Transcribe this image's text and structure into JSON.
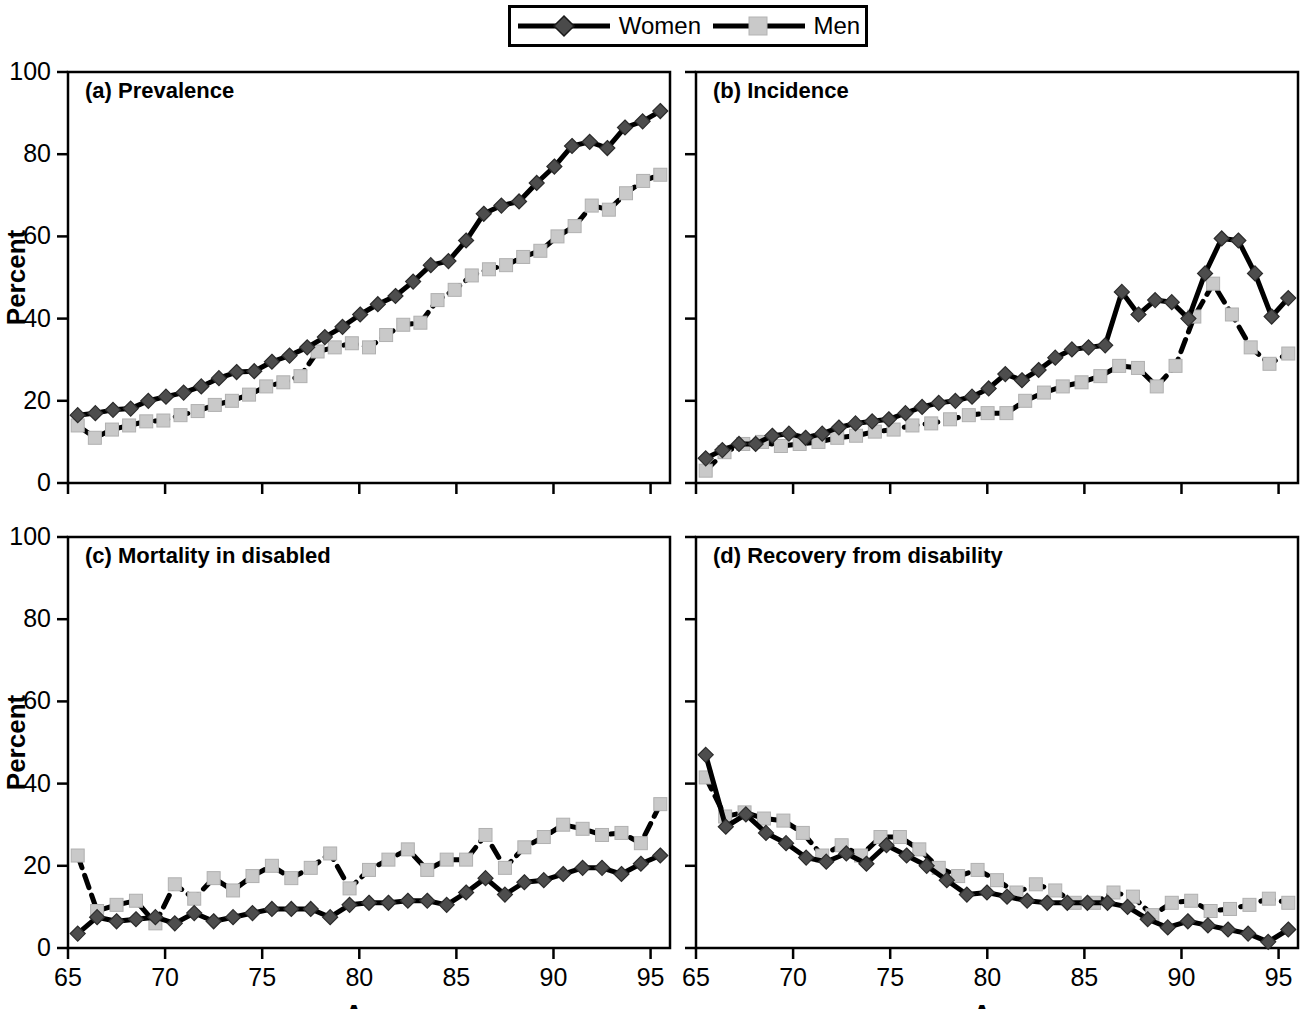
{
  "figure": {
    "width": 1308,
    "height": 1009,
    "background": "#ffffff"
  },
  "legend": {
    "entries": [
      {
        "label": "Women",
        "marker": "diamond",
        "marker_color": "#4d4d4d",
        "line_color": "#000000",
        "line_style": "solid"
      },
      {
        "label": "Men",
        "marker": "square",
        "marker_color": "#c9c9c9",
        "line_color": "#000000",
        "line_style": "dashed"
      }
    ]
  },
  "axis": {
    "x_title": "Age",
    "y_title": "Percent",
    "x_ticks": [
      65,
      70,
      75,
      80,
      85,
      90,
      95
    ],
    "y_ticks": [
      0,
      20,
      40,
      60,
      80,
      100
    ],
    "xlim": [
      65,
      96
    ],
    "ylim": [
      0,
      100
    ]
  },
  "chart_data": [
    {
      "type": "line",
      "panel": "a",
      "title": "(a) Prevalence",
      "xlabel": "Age",
      "ylabel": "Percent",
      "xlim": [
        65,
        96
      ],
      "ylim": [
        0,
        100
      ],
      "grid": false,
      "legend_position": "top-center-shared",
      "x": [
        65.5,
        66.5,
        67.5,
        68.5,
        69.5,
        70.5,
        71.5,
        72.5,
        73.5,
        74.5,
        75.5,
        76.5,
        77.5,
        78.5,
        79.5,
        80.5,
        81.5,
        82.5,
        83.5,
        84.5,
        85.5,
        86.5,
        87.5,
        88.5,
        89.5,
        90.5,
        91.5,
        92.5,
        93.5,
        94.5,
        95.5
      ],
      "series": [
        {
          "name": "Women",
          "values": [
            16.5,
            17.0,
            17.8,
            18.1,
            20.0,
            21.0,
            22.0,
            23.5,
            25.5,
            27.0,
            27.2,
            29.5,
            31.0,
            33.0,
            35.5,
            38.0,
            41.0,
            43.5,
            45.5,
            49.0,
            53.0,
            54.0,
            59.0,
            65.5,
            67.5,
            68.5,
            73.0,
            77.0,
            82.0,
            83.0,
            81.5,
            86.5,
            88.0,
            90.5
          ]
        },
        {
          "name": "Men",
          "values": [
            14.0,
            11.0,
            13.0,
            14.0,
            15.0,
            15.2,
            16.5,
            17.5,
            19.0,
            20.0,
            21.5,
            23.5,
            24.5,
            26.0,
            32.0,
            33.0,
            34.0,
            33.0,
            36.0,
            38.5,
            39.0,
            44.5,
            47.0,
            50.5,
            52.0,
            53.0,
            55.0,
            56.5,
            60.0,
            62.5,
            67.5,
            66.5,
            70.5,
            73.5,
            75.0
          ]
        }
      ]
    },
    {
      "type": "line",
      "panel": "b",
      "title": "(b) Incidence",
      "xlabel": "Age",
      "ylabel": "",
      "xlim": [
        65,
        96
      ],
      "ylim": [
        0,
        100
      ],
      "grid": false,
      "legend_position": "top-center-shared",
      "x": [
        65.5,
        66.5,
        67.5,
        68.5,
        69.5,
        70.5,
        71.5,
        72.5,
        73.5,
        74.5,
        75.5,
        76.5,
        77.5,
        78.5,
        79.5,
        80.5,
        81.5,
        82.5,
        83.5,
        84.5,
        85.5,
        86.5,
        87.5,
        88.5,
        89.5,
        90.5,
        91.5,
        92.5,
        93.5,
        94.5,
        95.5
      ],
      "series": [
        {
          "name": "Women",
          "values": [
            6.0,
            8.0,
            9.5,
            9.5,
            11.5,
            12.0,
            11.0,
            12.0,
            13.5,
            14.5,
            15.0,
            15.5,
            17.0,
            18.5,
            19.5,
            20.0,
            21.0,
            23.0,
            26.5,
            25.0,
            27.5,
            30.5,
            32.5,
            33.0,
            33.5,
            46.5,
            41.0,
            44.5,
            44.0,
            40.0,
            51.0,
            59.5,
            59.0,
            51.0,
            40.5,
            45.0
          ]
        },
        {
          "name": "Men",
          "values": [
            3.0,
            7.5,
            9.5,
            10.0,
            9.0,
            9.5,
            10.0,
            11.0,
            11.5,
            12.5,
            13.0,
            14.0,
            14.5,
            15.5,
            16.5,
            17.0,
            17.0,
            20.0,
            22.0,
            23.5,
            24.5,
            26.0,
            28.5,
            28.0,
            23.5,
            28.5,
            40.5,
            48.5,
            41.0,
            33.0,
            29.0,
            31.5
          ]
        }
      ]
    },
    {
      "type": "line",
      "panel": "c",
      "title": "(c) Mortality in disabled",
      "xlabel": "Age",
      "ylabel": "Percent",
      "xlim": [
        65,
        96
      ],
      "ylim": [
        0,
        100
      ],
      "grid": false,
      "legend_position": "top-center-shared",
      "x": [
        65.5,
        66.5,
        67.5,
        68.5,
        69.5,
        70.5,
        71.5,
        72.5,
        73.5,
        74.5,
        75.5,
        76.5,
        77.5,
        78.5,
        79.5,
        80.5,
        81.5,
        82.5,
        83.5,
        84.5,
        85.5,
        86.5,
        87.5,
        88.5,
        89.5,
        90.5,
        91.5,
        92.5,
        93.5,
        94.5,
        95.5
      ],
      "series": [
        {
          "name": "Women",
          "values": [
            3.5,
            7.5,
            6.5,
            7.0,
            7.5,
            6.0,
            8.5,
            6.5,
            7.5,
            8.5,
            9.5,
            9.5,
            9.5,
            7.5,
            10.5,
            11.0,
            11.0,
            11.5,
            11.5,
            10.5,
            13.5,
            17.0,
            13.0,
            16.0,
            16.5,
            18.0,
            19.5,
            19.5,
            18.0,
            20.5,
            22.5
          ]
        },
        {
          "name": "Men",
          "values": [
            22.5,
            9.0,
            10.5,
            11.5,
            6.0,
            15.5,
            12.0,
            17.0,
            14.0,
            17.5,
            20.0,
            17.0,
            19.5,
            23.0,
            14.5,
            19.0,
            21.5,
            24.0,
            19.0,
            21.5,
            21.5,
            27.5,
            19.5,
            24.5,
            27.0,
            30.0,
            29.0,
            27.5,
            28.0,
            25.5,
            35.0
          ]
        }
      ]
    },
    {
      "type": "line",
      "panel": "d",
      "title": "(d) Recovery from disability",
      "xlabel": "Age",
      "ylabel": "",
      "xlim": [
        65,
        96
      ],
      "ylim": [
        0,
        100
      ],
      "grid": false,
      "legend_position": "top-center-shared",
      "x": [
        65.5,
        66.5,
        67.5,
        68.5,
        69.5,
        70.5,
        71.5,
        72.5,
        73.5,
        74.5,
        75.5,
        76.5,
        77.5,
        78.5,
        79.5,
        80.5,
        81.5,
        82.5,
        83.5,
        84.5,
        85.5,
        86.5,
        87.5,
        88.5,
        89.5,
        90.5,
        91.5,
        92.5,
        93.5,
        94.5,
        95.5
      ],
      "series": [
        {
          "name": "Women",
          "values": [
            47.0,
            29.5,
            32.5,
            28.0,
            25.5,
            22.0,
            21.0,
            23.0,
            20.5,
            25.0,
            22.5,
            20.0,
            16.5,
            13.0,
            13.5,
            12.5,
            11.5,
            11.0,
            11.0,
            11.0,
            11.0,
            10.0,
            7.0,
            5.0,
            6.5,
            5.5,
            4.5,
            3.5,
            1.5,
            4.5
          ]
        },
        {
          "name": "Men",
          "values": [
            41.5,
            32.0,
            33.0,
            31.5,
            31.0,
            28.0,
            22.5,
            25.0,
            22.5,
            27.0,
            27.0,
            24.0,
            19.5,
            17.5,
            19.0,
            16.5,
            13.5,
            15.5,
            14.0,
            11.0,
            11.0,
            13.5,
            12.5,
            8.0,
            11.0,
            11.5,
            9.0,
            9.5,
            10.5,
            12.0,
            11.0
          ]
        }
      ]
    }
  ]
}
